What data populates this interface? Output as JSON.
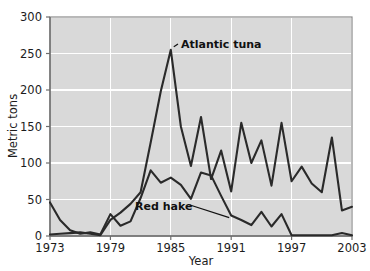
{
  "chart_data": {
    "type": "line",
    "title": "",
    "subtitle": "",
    "xlabel": "Year",
    "ylabel": "Metric tons",
    "xlim": [
      1973,
      2003
    ],
    "ylim": [
      0,
      300
    ],
    "xticks": [
      1973,
      1979,
      1985,
      1991,
      1997,
      2003
    ],
    "yticks": [
      0,
      50,
      100,
      150,
      200,
      250,
      300
    ],
    "grid": true,
    "legend_position": "inline-annotations",
    "line_color": "#2a2a2a",
    "plot_background": "#d9d9d9",
    "grid_color": "#ffffff",
    "x": [
      1973,
      1974,
      1975,
      1976,
      1977,
      1978,
      1979,
      1980,
      1981,
      1982,
      1983,
      1984,
      1985,
      1986,
      1987,
      1988,
      1989,
      1990,
      1991,
      1992,
      1993,
      1994,
      1995,
      1996,
      1997,
      1998,
      1999,
      2000,
      2001,
      2002,
      2003
    ],
    "series": [
      {
        "name": "Atlantic tuna",
        "label": "Atlantic tuna",
        "values": [
          2,
          3,
          4,
          5,
          3,
          1,
          22,
          32,
          44,
          60,
          128,
          198,
          255,
          150,
          96,
          163,
          78,
          117,
          61,
          155,
          100,
          131,
          69,
          155,
          75,
          95,
          72,
          60,
          135,
          35,
          40
        ]
      },
      {
        "name": "Red hake",
        "label": "Red hake",
        "values": [
          46,
          22,
          8,
          3,
          5,
          2,
          30,
          14,
          20,
          52,
          90,
          73,
          80,
          70,
          51,
          87,
          83,
          55,
          28,
          22,
          15,
          33,
          13,
          30,
          1,
          1,
          1,
          1,
          1,
          4,
          1
        ]
      }
    ],
    "annotations": [
      {
        "text": "Atlantic tuna",
        "target_x": 1985,
        "target_y": 255
      },
      {
        "text": "Red hake",
        "target_x": 1991,
        "target_y": 28
      }
    ]
  }
}
